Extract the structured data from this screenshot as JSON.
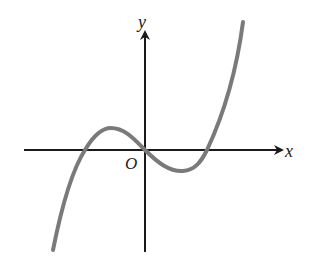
{
  "figure": {
    "type": "cubic-function-graph",
    "axis_labels": {
      "x": "x",
      "y": "y",
      "origin": "O"
    },
    "colors": {
      "axes": "#1a1a1a",
      "curve": "#7a7a7a",
      "background": "#ffffff"
    },
    "features": {
      "roots": [
        "negative root",
        "0 (origin)",
        "positive root"
      ],
      "local_maximum": "left of y-axis, above x-axis",
      "local_minimum": "right of y-axis, below x-axis"
    }
  }
}
